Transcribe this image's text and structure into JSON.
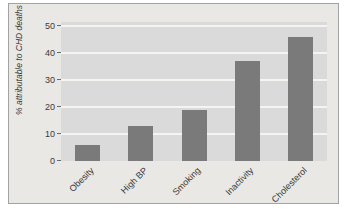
{
  "figure": {
    "y_axis_label": "% attributable to CHD deaths"
  },
  "chart_data": {
    "type": "bar",
    "categories": [
      "Obesity",
      "High BP",
      "Smoking",
      "Inactivity",
      "Cholesterol"
    ],
    "values": [
      6,
      13,
      19,
      37,
      46
    ],
    "title": "",
    "xlabel": "",
    "ylabel": "% attributable to CHD deaths",
    "ylim": [
      0,
      50
    ],
    "yticks": [
      0,
      10,
      20,
      30,
      40,
      50
    ],
    "grid": "horizontal",
    "legend": "none",
    "x_tick_rotation_deg": -45
  },
  "colors": {
    "page_background": "#ffffff",
    "panel_background": "#e9e8e4",
    "panel_border": "#a3a3a3",
    "plot_background": "#dadada",
    "gridline": "#f4f4f1",
    "bar": "#7a7a7a",
    "text": "#3a3a3a"
  }
}
